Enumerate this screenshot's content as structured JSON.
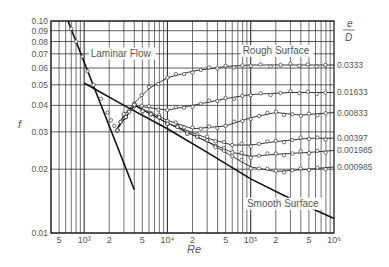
{
  "chart_data": {
    "type": "line",
    "title": "",
    "xlabel": "Re",
    "ylabel": "f",
    "x_scale": "log",
    "y_scale": "log",
    "xlim": [
      400,
      1000000
    ],
    "ylim": [
      0.01,
      0.1
    ],
    "grid": true,
    "x_tick_labels": [
      {
        "value": 500,
        "label": "5"
      },
      {
        "value": 1000,
        "label": "10³"
      },
      {
        "value": 2000,
        "label": "2"
      },
      {
        "value": 5000,
        "label": "5"
      },
      {
        "value": 10000,
        "label": "10⁴"
      },
      {
        "value": 20000,
        "label": "2"
      },
      {
        "value": 50000,
        "label": "5"
      },
      {
        "value": 100000,
        "label": "10⁵"
      },
      {
        "value": 200000,
        "label": "2"
      },
      {
        "value": 500000,
        "label": "5"
      },
      {
        "value": 1000000,
        "label": "10⁶"
      }
    ],
    "y_tick_labels": [
      {
        "value": 0.1,
        "label": "0.10"
      },
      {
        "value": 0.09,
        "label": "0.09"
      },
      {
        "value": 0.08,
        "label": "0.08"
      },
      {
        "value": 0.07,
        "label": "0.07"
      },
      {
        "value": 0.06,
        "label": "0.06"
      },
      {
        "value": 0.05,
        "label": "0.05"
      },
      {
        "value": 0.04,
        "label": "0.04"
      },
      {
        "value": 0.03,
        "label": "0.03"
      },
      {
        "value": 0.02,
        "label": "0.02"
      },
      {
        "value": 0.01,
        "label": "0.01"
      }
    ],
    "legend": {
      "title_numerator": "e",
      "title_denominator": "D",
      "position": "right"
    },
    "annotations": [
      {
        "text": "Laminar Flow",
        "x": 1200,
        "y": 0.068
      },
      {
        "text": "Rough Surface",
        "x": 80000,
        "y": 0.07
      },
      {
        "text": "Smooth Surface",
        "x": 90000,
        "y": 0.0133
      }
    ],
    "lines": [
      {
        "name": "Laminar Flow (f = 64/Re)",
        "x": [
          640,
          4000
        ],
        "y": [
          0.1,
          0.016
        ]
      },
      {
        "name": "Smooth Surface",
        "x": [
          1000,
          3000,
          10000,
          30000,
          100000,
          300000,
          1000000
        ],
        "y": [
          0.051,
          0.04,
          0.031,
          0.024,
          0.018,
          0.0145,
          0.0117
        ]
      }
    ],
    "series": [
      {
        "name": "0.0333",
        "label": "0.0333",
        "x": [
          2500,
          3000,
          4000,
          6000,
          10000,
          20000,
          50000,
          100000,
          300000,
          1000000
        ],
        "y": [
          0.031,
          0.036,
          0.041,
          0.048,
          0.054,
          0.058,
          0.061,
          0.062,
          0.062,
          0.062
        ]
      },
      {
        "name": "0.01633",
        "label": "0.01633",
        "x": [
          2500,
          3000,
          4000,
          6000,
          10000,
          20000,
          50000,
          100000,
          300000,
          1000000
        ],
        "y": [
          0.031,
          0.036,
          0.04,
          0.039,
          0.038,
          0.04,
          0.043,
          0.045,
          0.046,
          0.046
        ]
      },
      {
        "name": "0.00833",
        "label": "0.00833",
        "x": [
          2500,
          4000,
          10000,
          20000,
          50000,
          100000,
          200000,
          400000,
          1000000
        ],
        "y": [
          0.031,
          0.04,
          0.034,
          0.031,
          0.032,
          0.035,
          0.037,
          0.036,
          0.037
        ]
      },
      {
        "name": "0.00397",
        "label": "0.00397",
        "x": [
          2500,
          4000,
          10000,
          30000,
          60000,
          100000,
          200000,
          500000,
          1000000
        ],
        "y": [
          0.031,
          0.04,
          0.033,
          0.028,
          0.026,
          0.026,
          0.027,
          0.028,
          0.028
        ]
      },
      {
        "name": "0.001985",
        "label": "0.001985",
        "x": [
          2500,
          4000,
          10000,
          30000,
          60000,
          100000,
          200000,
          500000,
          1000000
        ],
        "y": [
          0.031,
          0.04,
          0.033,
          0.027,
          0.024,
          0.023,
          0.0235,
          0.024,
          0.0245
        ]
      },
      {
        "name": "0.000985",
        "label": "0.000985",
        "x": [
          2500,
          4000,
          10000,
          30000,
          60000,
          100000,
          200000,
          500000,
          1000000
        ],
        "y": [
          0.031,
          0.04,
          0.033,
          0.027,
          0.023,
          0.0205,
          0.0195,
          0.02,
          0.0205
        ]
      }
    ]
  }
}
